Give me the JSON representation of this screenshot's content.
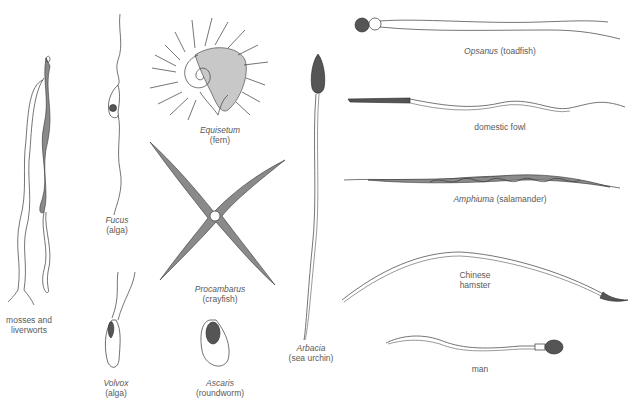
{
  "figure": {
    "specimens": [
      {
        "id": "mosses",
        "line1": "mosses and",
        "line2": "liverworts",
        "italic": false
      },
      {
        "id": "fucus",
        "sci": "Fucus",
        "common": "(alga)"
      },
      {
        "id": "volvox",
        "sci": "Volvox",
        "common": "(alga)"
      },
      {
        "id": "equisetum",
        "sci": "Equisetum",
        "common": "(fern)"
      },
      {
        "id": "procambarus",
        "sci": "Procambarus",
        "common": "(crayfish)"
      },
      {
        "id": "ascaris",
        "sci": "Ascaris",
        "common": "(roundworm)"
      },
      {
        "id": "arbacia",
        "sci": "Arbacia",
        "common": "(sea urchin)"
      },
      {
        "id": "opsanus",
        "sci": "Opsanus",
        "common": "(toadfish)"
      },
      {
        "id": "fowl",
        "line1": "domestic fowl"
      },
      {
        "id": "amphiuma",
        "sci": "Amphiuma",
        "common": "(salamander)"
      },
      {
        "id": "hamster",
        "line1": "Chinese",
        "line2": "hamster"
      },
      {
        "id": "man",
        "line1": "man"
      }
    ]
  }
}
